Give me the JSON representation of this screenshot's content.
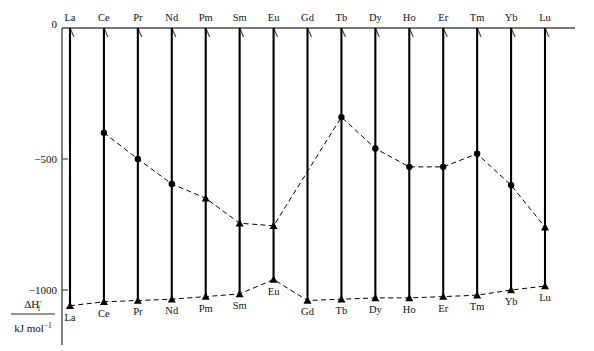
{
  "chart_data": {
    "type": "line",
    "title": "",
    "subtitle": "",
    "xlabel": "",
    "ylabel": "ΔH°f / kJ mol⁻¹",
    "ylabel_numerator": "ΔH",
    "ylabel_numerator_sup": "◦",
    "ylabel_numerator_sub": "f",
    "ylabel_denominator": "kJ mol",
    "ylabel_denominator_sup": "−1",
    "ylim": [
      -1150,
      0
    ],
    "ytick_values": [
      0,
      -500,
      -1000
    ],
    "ytick_labels": [
      "0",
      "−500",
      "−1000"
    ],
    "grid": false,
    "legend_position": "none",
    "categories": [
      "La",
      "Ce",
      "Pr",
      "Nd",
      "Pm",
      "Sm",
      "Eu",
      "Gd",
      "Tb",
      "Dy",
      "Ho",
      "Er",
      "Tm",
      "Yb",
      "Lu"
    ],
    "categories_top": [
      "La",
      "Ce",
      "Pr",
      "Nd",
      "Pm",
      "Sm",
      "Eu",
      "Gd",
      "Tb",
      "Dy",
      "Ho",
      "Er",
      "Tm",
      "Yb",
      "Lu"
    ],
    "categories_bottom": [
      "La",
      "Ce",
      "Pr",
      "Nd",
      "Pm",
      "Sm",
      "Eu",
      "Gd",
      "Tb",
      "Dy",
      "Ho",
      "Er",
      "Tm",
      "Yb",
      "Lu"
    ],
    "series": [
      {
        "name": "Upper dashed series (filled circles and triangles)",
        "marker": "circle",
        "linestyle": "dashed",
        "points": [
          {
            "x": "Ce",
            "y": -400,
            "marker": "circle"
          },
          {
            "x": "Pr",
            "y": -500,
            "marker": "circle"
          },
          {
            "x": "Nd",
            "y": -595,
            "marker": "circle"
          },
          {
            "x": "Pm",
            "y": -650,
            "marker": "triangle"
          },
          {
            "x": "Sm",
            "y": -745,
            "marker": "triangle"
          },
          {
            "x": "Eu",
            "y": -755,
            "marker": "triangle"
          },
          {
            "x": "Tb",
            "y": -340,
            "marker": "circle"
          },
          {
            "x": "Dy",
            "y": -460,
            "marker": "circle"
          },
          {
            "x": "Ho",
            "y": -530,
            "marker": "circle"
          },
          {
            "x": "Er",
            "y": -530,
            "marker": "circle"
          },
          {
            "x": "Tm",
            "y": -480,
            "marker": "circle"
          },
          {
            "x": "Yb",
            "y": -600,
            "marker": "circle"
          },
          {
            "x": "Lu",
            "y": -760,
            "marker": "triangle"
          }
        ]
      },
      {
        "name": "Lower dashed series (filled triangles)",
        "marker": "triangle",
        "linestyle": "dashed",
        "points": [
          {
            "x": "La",
            "y": -1060,
            "marker": "triangle"
          },
          {
            "x": "Ce",
            "y": -1045,
            "marker": "triangle"
          },
          {
            "x": "Pr",
            "y": -1040,
            "marker": "triangle"
          },
          {
            "x": "Nd",
            "y": -1035,
            "marker": "triangle"
          },
          {
            "x": "Pm",
            "y": -1025,
            "marker": "triangle"
          },
          {
            "x": "Sm",
            "y": -1015,
            "marker": "triangle"
          },
          {
            "x": "Eu",
            "y": -960,
            "marker": "triangle"
          },
          {
            "x": "Gd",
            "y": -1040,
            "marker": "triangle"
          },
          {
            "x": "Tb",
            "y": -1035,
            "marker": "triangle"
          },
          {
            "x": "Dy",
            "y": -1030,
            "marker": "triangle"
          },
          {
            "x": "Ho",
            "y": -1030,
            "marker": "triangle"
          },
          {
            "x": "Er",
            "y": -1025,
            "marker": "triangle"
          },
          {
            "x": "Tm",
            "y": -1020,
            "marker": "triangle"
          },
          {
            "x": "Yb",
            "y": -1000,
            "marker": "triangle"
          },
          {
            "x": "Lu",
            "y": -985,
            "marker": "triangle"
          }
        ]
      }
    ],
    "solid_lines_description": "One steep solid line descends from y=0 at each element's top tick down to that element's lower-series triangle point",
    "solid_lines": [
      {
        "from": "La",
        "to": "La"
      },
      {
        "from": "Ce",
        "to": "Ce"
      },
      {
        "from": "Pr",
        "to": "Pr"
      },
      {
        "from": "Nd",
        "to": "Nd"
      },
      {
        "from": "Pm",
        "to": "Pm"
      },
      {
        "from": "Sm",
        "to": "Sm"
      },
      {
        "from": "Eu",
        "to": "Eu"
      },
      {
        "from": "Gd",
        "to": "Gd"
      },
      {
        "from": "Tb",
        "to": "Tb"
      },
      {
        "from": "Dy",
        "to": "Dy"
      },
      {
        "from": "Ho",
        "to": "Ho"
      },
      {
        "from": "Er",
        "to": "Er"
      },
      {
        "from": "Tm",
        "to": "Tm"
      },
      {
        "from": "Yb",
        "to": "Yb"
      },
      {
        "from": "Lu",
        "to": "Lu"
      }
    ],
    "colors": {
      "line": "#000000",
      "axis": "#4a4a4a",
      "marker": "#000000",
      "background": "#ffffff"
    }
  }
}
